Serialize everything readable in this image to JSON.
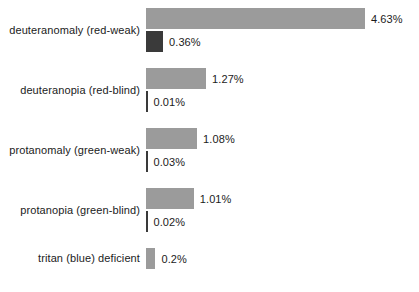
{
  "chart_data": {
    "type": "bar",
    "orientation": "horizontal",
    "title": "",
    "xlabel": "",
    "ylabel": "",
    "xlim": [
      0,
      4.63
    ],
    "grid": false,
    "legend": false,
    "categories": [
      "deuteranomaly (red-weak)",
      "deuteranopia (red-blind)",
      "protanomaly (green-weak)",
      "protanopia (green-blind)",
      "tritan (blue) deficient"
    ],
    "series": [
      {
        "name": "primary",
        "color": "#9b9b9b",
        "values": [
          4.63,
          1.27,
          1.08,
          1.01,
          0.2
        ],
        "labels": [
          "4.63%",
          "1.27%",
          "1.08%",
          "1.01%",
          "0.2%"
        ]
      },
      {
        "name": "secondary",
        "color": "#3a3a3a",
        "values": [
          0.36,
          0.01,
          0.03,
          0.02,
          null
        ],
        "labels": [
          "0.36%",
          "0.01%",
          "0.03%",
          "0.02%",
          null
        ]
      }
    ]
  },
  "colors": {
    "background": "#ffffff",
    "text": "#1b1b1b"
  }
}
